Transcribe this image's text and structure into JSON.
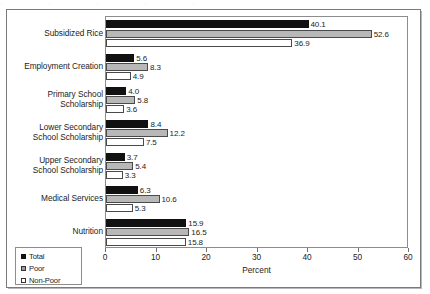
{
  "figure": {
    "artifact_top_text": "· · · · ·",
    "frame": true
  },
  "chart_data": {
    "type": "bar",
    "orientation": "horizontal",
    "title": "",
    "xlabel": "Percent",
    "ylabel": "",
    "xlim": [
      0,
      60
    ],
    "xticks": [
      0,
      10,
      20,
      30,
      40,
      50,
      60
    ],
    "xtick_labels": [
      "0",
      "10",
      "20",
      "30",
      "40",
      "50",
      "60"
    ],
    "grid": false,
    "legend_position": "bottom-left",
    "categories": [
      "Subsidized Rice",
      "Employment Creation",
      "Primary School Scholarship",
      "Lower Secondary School Scholarship",
      "Upper Secondary School Scholarship",
      "Medical Services",
      "Nutrition"
    ],
    "category_lines": [
      [
        "Subsidized Rice"
      ],
      [
        "Employment Creation"
      ],
      [
        "Primary School",
        "Scholarship"
      ],
      [
        "Lower Secondary",
        "School Scholarship"
      ],
      [
        "Upper Secondary",
        "School Scholarship"
      ],
      [
        "Medical Services"
      ],
      [
        "Nutrition"
      ]
    ],
    "series": [
      {
        "name": "Total",
        "color": "#111111",
        "values": [
          40.1,
          5.6,
          4.0,
          8.4,
          3.7,
          6.3,
          15.9
        ],
        "labels": [
          "40.1",
          "5.6",
          "4.0",
          "8.4",
          "3.7",
          "6.3",
          "15.9"
        ]
      },
      {
        "name": "Poor",
        "color": "#b8b8b8",
        "values": [
          52.6,
          8.3,
          5.8,
          12.2,
          5.4,
          10.6,
          16.5
        ],
        "labels": [
          "52.6",
          "8.3",
          "5.8",
          "12.2",
          "5.4",
          "10.6",
          "16.5"
        ]
      },
      {
        "name": "Non-Poor",
        "color": "#ffffff",
        "values": [
          36.9,
          4.9,
          3.6,
          7.5,
          3.3,
          5.3,
          15.8
        ],
        "labels": [
          "36.9",
          "4.9",
          "3.6",
          "7.5",
          "3.3",
          "5.3",
          "15.8"
        ]
      }
    ],
    "legend": [
      {
        "label": "Total",
        "swatch": "total"
      },
      {
        "label": "Poor",
        "swatch": "poor"
      },
      {
        "label": "Non-Poor",
        "swatch": "nonpoor"
      }
    ]
  }
}
